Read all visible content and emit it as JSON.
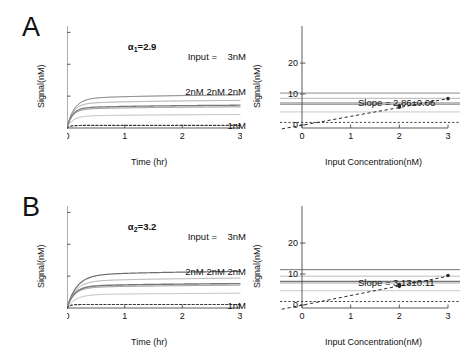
{
  "figure": {
    "panels": [
      {
        "letter": "A",
        "alpha_label": "α",
        "alpha_sub": "1",
        "alpha_value": "=2.9",
        "input_line1": "Input =    3nM",
        "input_line2": "2nM 2nM 2nM",
        "input_line3": "1nM",
        "slope_text": "Slope = 2.86±0.06"
      },
      {
        "letter": "B",
        "alpha_label": "α",
        "alpha_sub": "2",
        "alpha_value": "=3.2",
        "input_line1": "Input =    3nM",
        "input_line2": "2nM 2nM 2nM",
        "input_line3": "1nM",
        "slope_text": "Slope = 3.13±0.11"
      }
    ],
    "axes": {
      "left_xlabel": "Time (hr)",
      "left_ylabel": "Signal(nM)",
      "right_xlabel": "Input Concentration(nM)",
      "right_ylabel": "Signal(nM)",
      "left_xticks": [
        "0",
        "1",
        "2",
        "3"
      ],
      "left_yticks": [
        "10",
        "20",
        "30"
      ],
      "right_xticks": [
        "0",
        "1",
        "2",
        "3"
      ],
      "right_yticks": [
        "0",
        "10",
        "20"
      ]
    }
  },
  "chart_data": [
    {
      "type": "line",
      "panel": "A",
      "subplot": "left",
      "title": "",
      "xlabel": "Time (hr)",
      "ylabel": "Signal(nM)",
      "xlim": [
        0,
        3
      ],
      "ylim": [
        0,
        32
      ],
      "grid": false,
      "legend": "none",
      "annotation": "α1=2.9",
      "input_annotation": [
        "Input = 3nM",
        "2nM 2nM 2nM",
        "1nM"
      ],
      "series": [
        {
          "name": "3nM",
          "input_nM": 3,
          "plateau": 10.3,
          "tau_hr": 0.12,
          "style": "solid",
          "color": "#6e6e6e",
          "width": 1.0
        },
        {
          "name": "2nM-a",
          "input_nM": 2,
          "plateau": 8.6,
          "tau_hr": 0.1,
          "style": "solid",
          "color": "#9a9a9a",
          "width": 0.9
        },
        {
          "name": "2nM-b",
          "input_nM": 2,
          "plateau": 7.1,
          "tau_hr": 0.09,
          "style": "solid",
          "color": "#7a7a7a",
          "width": 1.3
        },
        {
          "name": "2nM-c",
          "input_nM": 2,
          "plateau": 6.6,
          "tau_hr": 0.09,
          "style": "solid",
          "color": "#8c8c8c",
          "width": 1.0
        },
        {
          "name": "1nM",
          "input_nM": 1,
          "plateau": 4.2,
          "tau_hr": 0.1,
          "style": "solid",
          "color": "#b2b2b2",
          "width": 0.9
        },
        {
          "name": "0nM-control",
          "input_nM": 0,
          "plateau": 0.8,
          "tau_hr": 0.05,
          "style": "dashed",
          "color": "#3a3a3a",
          "width": 1.2
        }
      ],
      "x_sample": [
        0,
        0.05,
        0.1,
        0.15,
        0.2,
        0.3,
        0.4,
        0.6,
        0.8,
        1.0,
        1.4,
        1.8,
        2.2,
        2.6,
        3.0
      ]
    },
    {
      "type": "scatter",
      "panel": "A",
      "subplot": "right",
      "title": "",
      "xlabel": "Input Concentration(nM)",
      "ylabel": "Signal(nM)",
      "xlim": [
        0,
        3
      ],
      "ylim": [
        -1,
        32
      ],
      "grid": false,
      "legend": "none",
      "slope": 2.86,
      "slope_error": 0.06,
      "slope_label": "Slope = 2.86±0.06",
      "fit_intercept": -0.1,
      "fit_style": "dashed",
      "points": [
        {
          "x": 0,
          "y": 0.0
        },
        {
          "x": 2,
          "y": 5.7
        },
        {
          "x": 2,
          "y": 6.2
        },
        {
          "x": 3,
          "y": 8.5
        }
      ],
      "hlines_from_left_panel": [
        10.3,
        8.6,
        7.1,
        6.6,
        4.2,
        0.8
      ]
    },
    {
      "type": "line",
      "panel": "B",
      "subplot": "left",
      "title": "",
      "xlabel": "Time (hr)",
      "ylabel": "Signal(nM)",
      "xlim": [
        0,
        3
      ],
      "ylim": [
        0,
        32
      ],
      "grid": false,
      "legend": "none",
      "annotation": "α2=3.2",
      "input_annotation": [
        "Input = 3nM",
        "2nM 2nM 2nM",
        "1nM"
      ],
      "series": [
        {
          "name": "3nM",
          "input_nM": 3,
          "plateau": 11.4,
          "tau_hr": 0.16,
          "style": "solid",
          "color": "#6e6e6e",
          "width": 1.2
        },
        {
          "name": "2nM-a",
          "input_nM": 2,
          "plateau": 9.3,
          "tau_hr": 0.14,
          "style": "solid",
          "color": "#a0a0a0",
          "width": 0.9
        },
        {
          "name": "2nM-b",
          "input_nM": 2,
          "plateau": 7.6,
          "tau_hr": 0.12,
          "style": "solid",
          "color": "#767676",
          "width": 1.4
        },
        {
          "name": "2nM-c",
          "input_nM": 2,
          "plateau": 7.1,
          "tau_hr": 0.12,
          "style": "solid",
          "color": "#8c8c8c",
          "width": 1.0
        },
        {
          "name": "1nM",
          "input_nM": 1,
          "plateau": 4.6,
          "tau_hr": 0.14,
          "style": "solid",
          "color": "#b4b4b4",
          "width": 0.9
        },
        {
          "name": "0nM-control",
          "input_nM": 0,
          "plateau": 1.1,
          "tau_hr": 0.05,
          "style": "dashed",
          "color": "#3a3a3a",
          "width": 1.2
        }
      ],
      "x_sample": [
        0,
        0.05,
        0.1,
        0.15,
        0.2,
        0.3,
        0.4,
        0.6,
        0.8,
        1.0,
        1.4,
        1.8,
        2.2,
        2.6,
        3.0
      ]
    },
    {
      "type": "scatter",
      "panel": "B",
      "subplot": "right",
      "title": "",
      "xlabel": "Input Concentration(nM)",
      "ylabel": "Signal(nM)",
      "xlim": [
        0,
        3
      ],
      "ylim": [
        -1,
        32
      ],
      "grid": false,
      "legend": "none",
      "slope": 3.13,
      "slope_error": 0.11,
      "slope_label": "Slope = 3.13±0.11",
      "fit_intercept": -0.1,
      "fit_style": "dashed",
      "points": [
        {
          "x": 0,
          "y": 0.0
        },
        {
          "x": 2,
          "y": 6.0
        },
        {
          "x": 2,
          "y": 6.6
        },
        {
          "x": 3,
          "y": 9.5
        }
      ],
      "hlines_from_left_panel": [
        11.4,
        9.3,
        7.6,
        7.1,
        4.6,
        1.1
      ]
    }
  ]
}
